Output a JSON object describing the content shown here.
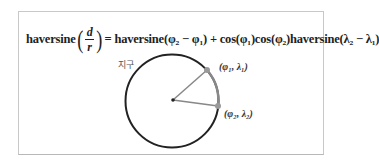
{
  "formula": {
    "lhs_func": "haversine",
    "lhs_numerator": "d",
    "lhs_denominator": "r",
    "rhs": "= haversine(φ₂ − φ₁) + cos(φ₁)cos(φ₂)haversine(λ₂ − λ₁)"
  },
  "diagram": {
    "sphere_label": "지구",
    "point1_label": "(φ₁, λ₁)",
    "point2_label": "(φ₂, λ₂)"
  },
  "colors": {
    "circle": "#222222",
    "radius_lines": "#888888",
    "points": "#999999",
    "arc": "#888888"
  }
}
